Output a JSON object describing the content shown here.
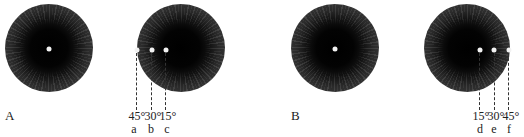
{
  "figure": {
    "panel_A": {
      "label": "A",
      "eyes": [
        {
          "id": "A-left",
          "center": [
            49,
            48
          ],
          "radius": 44,
          "fixation": "center"
        },
        {
          "id": "A-right",
          "center": [
            181,
            48
          ],
          "radius": 44
        }
      ],
      "markers": [
        {
          "angle": "45°",
          "letter": "a",
          "x": 137
        },
        {
          "angle": "30°",
          "letter": "b",
          "x": 152
        },
        {
          "angle": "15°",
          "letter": "c",
          "x": 166
        }
      ]
    },
    "panel_B": {
      "label": "B",
      "eyes": [
        {
          "id": "B-left",
          "center": [
            335,
            48
          ],
          "radius": 44,
          "fixation": "center"
        },
        {
          "id": "B-right",
          "center": [
            467,
            48
          ],
          "radius": 43
        }
      ],
      "markers": [
        {
          "angle": "15°",
          "letter": "d",
          "x": 480
        },
        {
          "angle": "30°",
          "letter": "e",
          "x": 494
        },
        {
          "angle": "45°",
          "letter": "f",
          "x": 509
        }
      ]
    }
  }
}
